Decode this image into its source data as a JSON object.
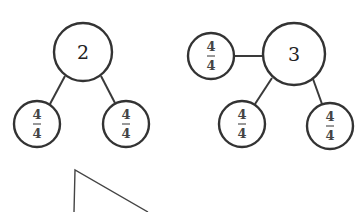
{
  "diagram": {
    "type": "number-bond",
    "bonds": [
      {
        "whole": {
          "label": "2",
          "cx": 83,
          "cy": 52,
          "r": 29
        },
        "parts": [
          {
            "numerator": "4",
            "denominator": "4",
            "cx": 37,
            "cy": 124,
            "r": 23
          },
          {
            "numerator": "4",
            "denominator": "4",
            "cx": 126,
            "cy": 124,
            "r": 23
          }
        ]
      },
      {
        "whole": {
          "label": "3",
          "cx": 294,
          "cy": 54,
          "r": 31
        },
        "parts": [
          {
            "numerator": "4",
            "denominator": "4",
            "cx": 211,
            "cy": 56,
            "r": 23
          },
          {
            "numerator": "4",
            "denominator": "4",
            "cx": 242,
            "cy": 124,
            "r": 23
          },
          {
            "numerator": "4",
            "denominator": "4",
            "cx": 330,
            "cy": 126,
            "r": 23
          }
        ]
      }
    ],
    "partial_shape": {
      "type": "triangle-fragment",
      "points": [
        [
          74,
          212
        ],
        [
          75,
          170
        ],
        [
          148,
          212
        ]
      ]
    },
    "colors": {
      "stroke": "#333333",
      "text": "#222222",
      "background": "#ffffff"
    }
  }
}
